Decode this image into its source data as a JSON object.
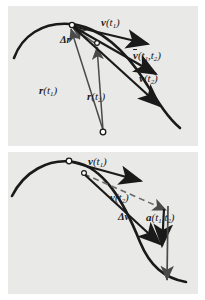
{
  "figure": {
    "background_color": "#e9e9e7",
    "page_color": "#ffffff",
    "ink_color": "#1a1a1a",
    "thin_line_color": "#5a5a5a"
  },
  "panels": [
    {
      "id": "top",
      "caption": "Position vectors r(t1), r(t2), displacement Δr, and velocity vectors",
      "labels": [
        {
          "key": "v_t1",
          "base": "v",
          "overbar": false,
          "args": "(t",
          "sub": "1",
          "close": ")",
          "text": "v(t₁)",
          "x": 101,
          "y": 17
        },
        {
          "key": "v_bar",
          "base": "v",
          "overbar": true,
          "args": "(t",
          "sub": "1",
          "close": ")",
          "text": "v̄(t₁,t₂)",
          "x": 133,
          "y": 50
        },
        {
          "key": "v_t2",
          "base": "v",
          "overbar": false,
          "args": "(t",
          "sub": "2",
          "close": ")",
          "text": "v(t₂)",
          "x": 139,
          "y": 73
        },
        {
          "key": "delta_r",
          "base": "Δr",
          "overbar": false,
          "args": "",
          "sub": "",
          "close": "",
          "text": "Δr",
          "x": 62,
          "y": 36
        },
        {
          "key": "r_t1",
          "base": "r",
          "overbar": false,
          "args": "(t",
          "sub": "1",
          "close": ")",
          "text": "r(t₁)",
          "x": 40,
          "y": 86
        },
        {
          "key": "r_t2",
          "base": "r",
          "overbar": false,
          "args": "(t",
          "sub": "2",
          "close": ")",
          "text": "r(t₂)",
          "x": 88,
          "y": 92
        }
      ],
      "points": [
        {
          "name": "point-t1",
          "x": 70,
          "y": 27
        },
        {
          "name": "point-t2",
          "x": 96,
          "y": 44
        },
        {
          "name": "origin",
          "x": 103,
          "y": 132
        }
      ]
    },
    {
      "id": "bottom",
      "caption": "Velocity vectors v(t1), v(t2), velocity change Δv, and average acceleration",
      "labels": [
        {
          "key": "v_t1",
          "base": "v",
          "overbar": false,
          "args": "(t",
          "sub": "1",
          "close": ")",
          "text": "v(t₁)",
          "x": 88,
          "y": 157
        },
        {
          "key": "v_t2",
          "base": "v",
          "overbar": false,
          "args": "(t",
          "sub": "2",
          "close": ")",
          "text": "v(t₂)",
          "x": 110,
          "y": 193
        },
        {
          "key": "delta_v",
          "base": "Δv",
          "overbar": false,
          "args": "",
          "sub": "",
          "close": "",
          "text": "Δv",
          "x": 119,
          "y": 213
        },
        {
          "key": "a_avg",
          "base": "a",
          "overbar": false,
          "args": "(t",
          "sub": "1",
          "close": ")",
          "text": "a(t₁,t₂)",
          "x": 147,
          "y": 213
        }
      ],
      "points": [
        {
          "name": "point-t1",
          "x": 70,
          "y": 162
        },
        {
          "name": "point-t2",
          "x": 85,
          "y": 173
        }
      ]
    }
  ]
}
